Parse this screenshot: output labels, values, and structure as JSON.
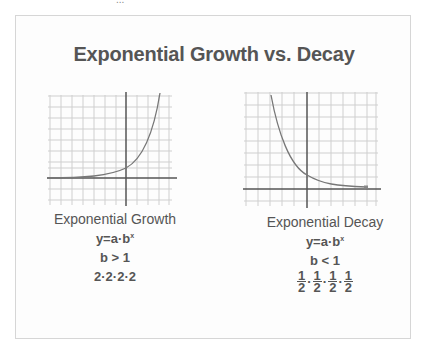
{
  "page": {
    "top_fragment": "..."
  },
  "title": "Exponential Growth vs. Decay",
  "colors": {
    "text": "#555555",
    "grid": "#cfcfcf",
    "axis": "#555555",
    "curve": "#777777",
    "card_border": "#d6d6d6"
  },
  "growth": {
    "caption": "Exponential Growth",
    "formula_base": "y=a·b",
    "formula_exp": "x",
    "condition": "b > 1",
    "example": "2·2·2·2"
  },
  "decay": {
    "caption": "Exponential Decay",
    "formula_base": "y=a·b",
    "formula_exp": "x",
    "condition": "b < 1",
    "example_fractions": [
      {
        "num": "1",
        "den": "2"
      },
      {
        "num": "1",
        "den": "2"
      },
      {
        "num": "1",
        "den": "2"
      },
      {
        "num": "1",
        "den": "2"
      }
    ],
    "example_separator": "·"
  }
}
